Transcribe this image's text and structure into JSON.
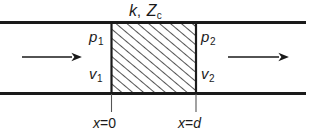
{
  "figure": {
    "type": "physics-diagram",
    "background_color": "#ffffff",
    "line_color": "#1a1a1a",
    "labels": {
      "material": {
        "symbol1": "k",
        "separator": ",",
        "symbol2": "Z",
        "symbol2_sub": "c"
      },
      "inlet_pressure": {
        "symbol": "p",
        "sub": "1"
      },
      "inlet_velocity": {
        "symbol": "v",
        "sub": "1"
      },
      "outlet_pressure": {
        "symbol": "p",
        "sub": "2"
      },
      "outlet_velocity": {
        "symbol": "v",
        "sub": "2"
      },
      "left_boundary": {
        "var": "x",
        "eq": "=",
        "value": "0"
      },
      "right_boundary": {
        "var": "x",
        "eq": "=",
        "value": "d"
      }
    },
    "geometry": {
      "duct_top_y": 22,
      "duct_bottom_y": 93,
      "duct_left_x": 0,
      "duct_right_x": 306,
      "block_left_x": 111,
      "block_right_x": 196,
      "leader_bottom_y": 112,
      "hatch_spacing": 7,
      "hatch_angle_deg": 50
    },
    "arrows": [
      {
        "name": "inlet-flow-arrow",
        "x1": 22,
        "x2": 78,
        "y": 57,
        "direction": "right"
      },
      {
        "name": "outlet-flow-arrow",
        "x1": 228,
        "x2": 286,
        "y": 57,
        "direction": "right"
      }
    ]
  }
}
